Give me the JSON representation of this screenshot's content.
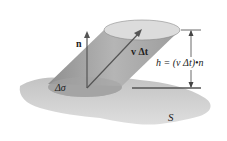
{
  "diagram": {
    "labels": {
      "normal": "n",
      "velocity": "v Δt",
      "height_formula": "h = (v Δt)•n",
      "area_element": "Δσ",
      "surface": "S"
    },
    "colors": {
      "surface": "#b8b8b8",
      "cylinder": "#a9a9a9",
      "cylinder_top": "#d9d9d9",
      "base_ellipse": "#a4a4a4",
      "arrow": "#555555",
      "line": "#444444"
    }
  }
}
